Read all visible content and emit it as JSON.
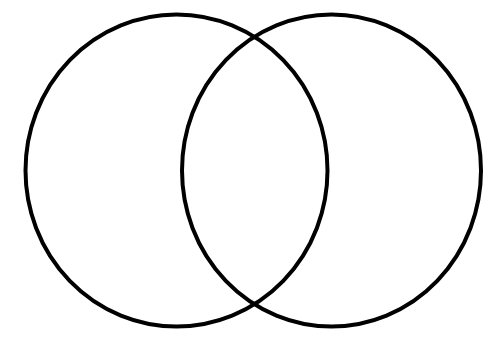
{
  "diagram": {
    "type": "venn",
    "sets": [
      {
        "id": "left",
        "label": ""
      },
      {
        "id": "right",
        "label": ""
      }
    ],
    "stroke_color": "#000000",
    "background_color": "#ffffff"
  }
}
